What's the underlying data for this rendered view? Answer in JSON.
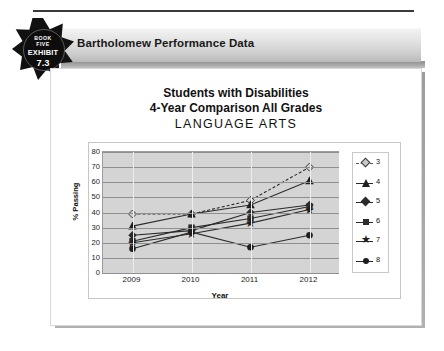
{
  "badge": {
    "book_line1": "BOOK",
    "book_line2": "FIVE",
    "exhibit_label": "EXHIBIT",
    "exhibit_number": "7.3"
  },
  "header": {
    "title": "Bartholomew Performance Data"
  },
  "chart_data": {
    "type": "line",
    "title": "Students with Disabilities",
    "subtitle": "4-Year Comparison All Grades",
    "subject": "LANGUAGE ARTS",
    "xlabel": "Year",
    "ylabel": "% Passing",
    "categories": [
      "2009",
      "2010",
      "2011",
      "2012"
    ],
    "ylim": [
      0,
      80
    ],
    "yticks": [
      "80",
      "70",
      "60",
      "50",
      "40",
      "30",
      "20",
      "10",
      "0"
    ],
    "grid": true,
    "legend_position": "right",
    "plot_background": "#d4d4d4",
    "line_color": "#2b2b2b",
    "series": [
      {
        "name": "3",
        "marker": "diamond-open",
        "style": "dashed",
        "values": [
          39,
          39,
          48,
          70
        ]
      },
      {
        "name": "4",
        "marker": "triangle",
        "style": "solid",
        "values": [
          31,
          39,
          45,
          61
        ]
      },
      {
        "name": "5",
        "marker": "diamond",
        "style": "solid",
        "values": [
          25,
          28,
          40,
          45
        ]
      },
      {
        "name": "6",
        "marker": "square",
        "style": "solid",
        "values": [
          21,
          30,
          36,
          44
        ]
      },
      {
        "name": "7",
        "marker": "star",
        "style": "solid",
        "values": [
          20,
          26,
          33,
          42
        ]
      },
      {
        "name": "8",
        "marker": "circle",
        "style": "solid",
        "values": [
          16,
          27,
          17,
          25
        ]
      }
    ]
  }
}
